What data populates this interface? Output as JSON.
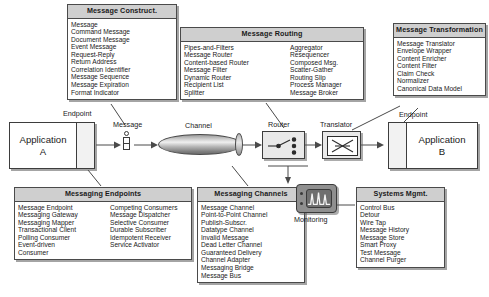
{
  "diagram": {
    "catalogs": [
      {
        "id": "message-construction",
        "title": "Message Construct.",
        "columns": [
          [
            "Message",
            "Command Message",
            "Document Message",
            "Event Message",
            "Request-Reply",
            "Return Address",
            "Correlation Identifier",
            "Message Sequence",
            "Message Expiration",
            "Format Indicator"
          ]
        ]
      },
      {
        "id": "message-routing",
        "title": "Message Routing",
        "columns": [
          [
            "Pipes-and-Filters",
            "Message Router",
            "Content-based Router",
            "Message Filter",
            "Dynamic Router",
            "Recipient List",
            "Splitter"
          ],
          [
            "Aggregator",
            "Resequencer",
            "Composed Msg.",
            "Scatter-Gather",
            "Routing Slip",
            "Process Manager",
            "Message Broker"
          ]
        ]
      },
      {
        "id": "message-transformation",
        "title": "Message Transformation",
        "columns": [
          [
            "Message Translator",
            "Envelope Wrapper",
            "Content Enricher",
            "Content Filter",
            "Claim Check",
            "Normalizer",
            "Canonical Data Model"
          ]
        ]
      },
      {
        "id": "messaging-endpoints",
        "title": "Messaging Endpoints",
        "columns": [
          [
            "Message Endpoint",
            "Messaging Gateway",
            "Messaging Mapper",
            "Transactional Client",
            "Polling Consumer",
            "Event-driven",
            "Consumer"
          ],
          [
            "Competing Consumers",
            "Message Dispatcher",
            "Selective Consumer",
            "Durable Subscriber",
            "Idempotent Receiver",
            "Service Activator"
          ]
        ]
      },
      {
        "id": "messaging-channels",
        "title": "Messaging Channels",
        "columns": [
          [
            "Message Channel",
            "Point-to-Point Channel",
            "Publish-Subscr.",
            "Datatype Channel",
            "Invalid Message",
            "Dead Letter Channel",
            "Guaranteed Delivery",
            "Channel Adapter",
            "Messaging Bridge",
            "Message Bus"
          ]
        ]
      },
      {
        "id": "systems-management",
        "title": "Systems Mgmt.",
        "columns": [
          [
            "Control Bus",
            "Detour",
            "Wire Tap",
            "Message History",
            "Message Store",
            "Smart Proxy",
            "Test Message",
            "Channel Purger"
          ]
        ]
      }
    ],
    "flow": {
      "application_a": {
        "line1": "Application",
        "line2": "A"
      },
      "application_b": {
        "line1": "Application",
        "line2": "B"
      },
      "labels": {
        "endpoint_left": "Endpoint",
        "endpoint_right": "Endpoint",
        "message": "Message",
        "channel": "Channel",
        "router": "Router",
        "translator": "Translator",
        "monitoring": "Monitoring"
      }
    },
    "colors": {
      "title_band": "#cfcfcf",
      "outline": "#4a4a4a",
      "pipe": "#b4b4b4",
      "monitor": "#8f8f8f",
      "paper": "#ffffff"
    }
  }
}
